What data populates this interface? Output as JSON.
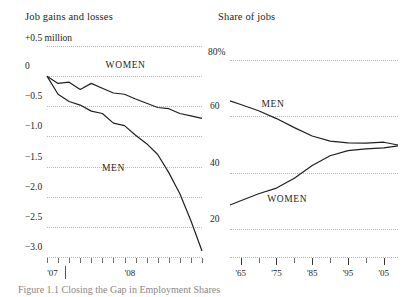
{
  "chart_data": [
    {
      "type": "line",
      "title": "Job gains and losses",
      "xlabel": "",
      "ylabel": "+0.5 million",
      "ylim": [
        -3.0,
        0.5
      ],
      "yticks": [
        0.5,
        0,
        -0.5,
        -1.0,
        -1.5,
        -2.0,
        -2.5,
        -3.0
      ],
      "ytick_labels": [
        "+0.5 million",
        "0",
        "−0.5",
        "−1.0",
        "−1.5",
        "−2.0",
        "−2.5",
        "−3.0"
      ],
      "grid": true,
      "legend_position": "inline-annotation",
      "x": [
        0,
        1,
        2,
        3,
        4,
        5,
        6,
        7,
        8,
        9,
        10,
        11,
        12,
        13,
        14
      ],
      "xtick_labels": [
        "'07",
        "'08"
      ],
      "xtick_label_positions": [
        0.5,
        7.5
      ],
      "series": [
        {
          "name": "WOMEN",
          "values": [
            0.0,
            -0.12,
            -0.1,
            -0.22,
            -0.12,
            -0.2,
            -0.28,
            -0.3,
            -0.38,
            -0.45,
            -0.52,
            -0.54,
            -0.62,
            -0.66,
            -0.7
          ]
        },
        {
          "name": "MEN",
          "values": [
            0.0,
            -0.3,
            -0.42,
            -0.48,
            -0.58,
            -0.62,
            -0.78,
            -0.82,
            -0.98,
            -1.12,
            -1.3,
            -1.6,
            -1.95,
            -2.4,
            -2.9
          ]
        }
      ],
      "annotations": [
        {
          "text": "WOMEN",
          "x": 7.1,
          "y": 0.18
        },
        {
          "text": "MEN",
          "x": 6.0,
          "y": -1.52
        }
      ]
    },
    {
      "type": "line",
      "title": "Share of jobs",
      "xlabel": "",
      "ylabel": "80%",
      "ylim": [
        10,
        85
      ],
      "yticks": [
        80,
        60,
        40,
        20
      ],
      "ytick_labels": [
        "80%",
        "60",
        "40",
        "20"
      ],
      "grid": true,
      "legend_position": "inline-annotation",
      "x": [
        1962,
        1965,
        1970,
        1975,
        1980,
        1985,
        1990,
        1995,
        2000,
        2005,
        2009
      ],
      "xtick_labels": [
        "'65",
        "'75",
        "'85",
        "'95",
        "'05"
      ],
      "xtick_label_positions": [
        1965,
        1975,
        1985,
        1995,
        2005
      ],
      "series": [
        {
          "name": "MEN",
          "values": [
            65.5,
            64.2,
            62.0,
            59.2,
            56.0,
            53.0,
            51.2,
            50.6,
            50.5,
            50.8,
            49.8
          ]
        },
        {
          "name": "WOMEN",
          "values": [
            28.5,
            30.0,
            32.5,
            34.5,
            38.0,
            42.5,
            46.0,
            47.8,
            48.4,
            48.8,
            49.5
          ]
        }
      ],
      "annotations": [
        {
          "text": "MEN",
          "x": 1974,
          "y": 64.5
        },
        {
          "text": "WOMEN",
          "x": 1978,
          "y": 30.5
        }
      ]
    }
  ],
  "styles": {
    "line_color": "#231f20",
    "grid_color": "#b9b4ad",
    "text_color": "#231f20",
    "background": "#ffffff"
  },
  "caption": {
    "partial_text": "Figure 1.1   Closing the Gap in Employment Shares"
  }
}
